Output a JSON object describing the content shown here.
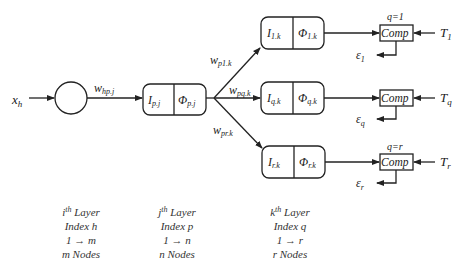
{
  "input": {
    "label": "x",
    "sub": "h"
  },
  "input_weight": {
    "label": "w",
    "sub": "hp.j"
  },
  "hidden_node": {
    "I_label": "I",
    "I_sub": "p.j",
    "Phi_label": "Φ",
    "Phi_sub": "p.j"
  },
  "branch_weights": [
    {
      "label": "w",
      "sub": "p1.k"
    },
    {
      "label": "w",
      "sub": "pq.k"
    },
    {
      "label": "w",
      "sub": "pr.k"
    }
  ],
  "output_nodes": [
    {
      "I_label": "I",
      "I_sub": "1.k",
      "Phi_label": "Φ",
      "Phi_sub": "1.k"
    },
    {
      "I_label": "I",
      "I_sub": "q.k",
      "Phi_label": "Φ",
      "Phi_sub": "q.k"
    },
    {
      "I_label": "I",
      "I_sub": "r.k",
      "Phi_label": "Φ",
      "Phi_sub": "r.k"
    }
  ],
  "comparators": [
    {
      "label": "Comp",
      "q_label": "q=1",
      "target": "T",
      "target_sub": "1",
      "error": "ε",
      "error_sub": "1"
    },
    {
      "label": "Comp",
      "q_label": "",
      "target": "T",
      "target_sub": "q",
      "error": "ε",
      "error_sub": "q"
    },
    {
      "label": "Comp",
      "q_label": "q=r",
      "target": "T",
      "target_sub": "r",
      "error": "ε",
      "error_sub": "r"
    }
  ],
  "layers": [
    {
      "title_base": "i",
      "title_sup": "th",
      "title_rest": " Layer",
      "index": "Index h",
      "range": "1 → m",
      "nodes": "m Nodes"
    },
    {
      "title_base": "j",
      "title_sup": "th",
      "title_rest": " Layer",
      "index": "Index p",
      "range": "1 → n",
      "nodes": "n Nodes"
    },
    {
      "title_base": "k",
      "title_sup": "th",
      "title_rest": " Layer",
      "index": "Index q",
      "range": "1 → r",
      "nodes": "r Nodes"
    }
  ]
}
